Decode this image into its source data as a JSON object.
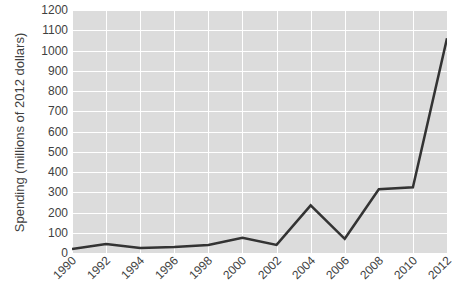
{
  "chart_data": {
    "type": "line",
    "title": "",
    "xlabel": "",
    "ylabel": "Spending (millions of 2012 dollars)",
    "categories": [
      "1990",
      "1992",
      "1994",
      "1996",
      "1998",
      "2000",
      "2002",
      "2004",
      "2006",
      "2008",
      "2010",
      "2012"
    ],
    "x": [
      1990,
      1992,
      1994,
      1996,
      1998,
      2000,
      2002,
      2004,
      2006,
      2008,
      2010,
      2012
    ],
    "values": [
      20,
      45,
      25,
      30,
      40,
      75,
      40,
      235,
      70,
      315,
      325,
      1060
    ],
    "series": [
      {
        "name": "Spending",
        "values": [
          20,
          45,
          25,
          30,
          40,
          75,
          40,
          235,
          70,
          315,
          325,
          1060
        ],
        "color": "#333333"
      }
    ],
    "ylim": [
      0,
      1200
    ],
    "ytick_values": [
      0,
      100,
      200,
      300,
      400,
      500,
      600,
      700,
      800,
      900,
      1000,
      1100,
      1200
    ],
    "ytick_labels": [
      "0",
      "100",
      "200",
      "300",
      "400",
      "500",
      "600",
      "700",
      "800",
      "900",
      "1000",
      "1100",
      "1200"
    ],
    "xlim": [
      1990,
      2012
    ],
    "grid": true,
    "grid_color": "#ffffff",
    "plot_background": "#dcdcdc",
    "legend": "none",
    "markers": "none",
    "line_width": 2.5
  }
}
